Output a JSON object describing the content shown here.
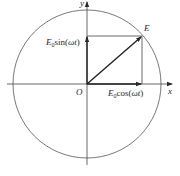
{
  "diagram": {
    "type": "phasor-circle",
    "colors": {
      "stroke": "#3a3a3a",
      "background": "#ffffff"
    },
    "axes": {
      "x_label": "x",
      "y_label": "y",
      "origin_label": "O"
    },
    "point": {
      "label": "E"
    },
    "components": {
      "vertical": {
        "base": "E",
        "sub": "0",
        "func": "sin(",
        "arg": "ωt",
        "close": ")"
      },
      "horizontal": {
        "base": "E",
        "sub": "0",
        "func": "cos(",
        "arg": "ωt",
        "close": ")"
      }
    }
  }
}
